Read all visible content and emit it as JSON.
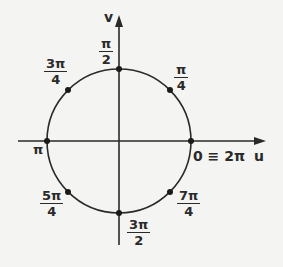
{
  "diagram": {
    "type": "unit-circle",
    "axes": {
      "horizontal": "u",
      "vertical": "v"
    },
    "colors": {
      "ink": "#2a2a2a",
      "background": "#f4f4f2"
    },
    "points": [
      {
        "angle": "0",
        "label": "0 ≡ 2π"
      },
      {
        "angle": "π/4",
        "numerator": "π",
        "denominator": "4"
      },
      {
        "angle": "π/2",
        "numerator": "π",
        "denominator": "2"
      },
      {
        "angle": "3π/4",
        "numerator": "3π",
        "denominator": "4"
      },
      {
        "angle": "π",
        "label": "π"
      },
      {
        "angle": "5π/4",
        "numerator": "5π",
        "denominator": "4"
      },
      {
        "angle": "3π/2",
        "numerator": "3π",
        "denominator": "2"
      },
      {
        "angle": "7π/4",
        "numerator": "7π",
        "denominator": "4"
      }
    ]
  }
}
